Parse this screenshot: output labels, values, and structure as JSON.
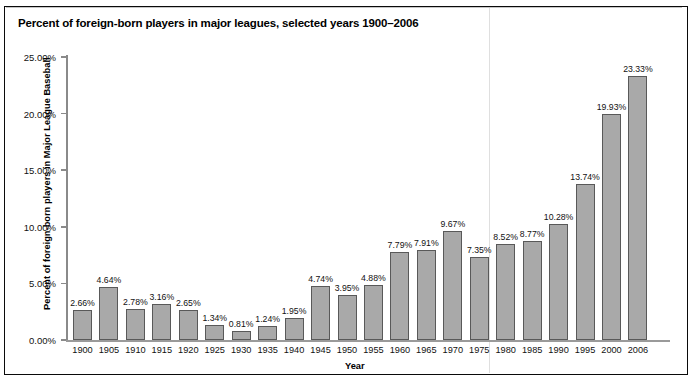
{
  "figure": {
    "title": "Percent of foreign-born players in major leagues, selected years 1900–2006",
    "xlabel": "Year",
    "ylabel": "Percent of foreign-born players in Major League Baseball",
    "bar_fill": "#a9a9a9",
    "bar_border": "#595959",
    "frame_color": "#0a0a0a"
  },
  "chart_data": {
    "type": "bar",
    "title": "Percent of foreign-born players in major leagues, selected years 1900–2006",
    "xlabel": "Year",
    "ylabel": "Percent of foreign-born players in Major League Baseball",
    "ylim": [
      0,
      25
    ],
    "ytick_labels": [
      "25.00%",
      "20.00%",
      "15.00%",
      "10.00%",
      "5.00%",
      "0.00%"
    ],
    "ytick_values": [
      25,
      20,
      15,
      10,
      5,
      0
    ],
    "grid": false,
    "legend": null,
    "categories": [
      "1900",
      "1905",
      "1910",
      "1915",
      "1920",
      "1925",
      "1930",
      "1935",
      "1940",
      "1945",
      "1950",
      "1955",
      "1960",
      "1965",
      "1970",
      "1975",
      "1980",
      "1985",
      "1990",
      "1995",
      "2000",
      "2006"
    ],
    "values": [
      2.66,
      4.64,
      2.78,
      3.16,
      2.65,
      1.34,
      0.81,
      1.24,
      1.95,
      4.74,
      3.95,
      4.88,
      7.79,
      7.91,
      9.67,
      7.35,
      8.52,
      8.77,
      10.28,
      13.74,
      19.93,
      23.33
    ],
    "data_labels": [
      "2.66%",
      "4.64%",
      "2.78%",
      "3.16%",
      "2.65%",
      "1.34%",
      "0.81%",
      "1.24%",
      "1.95%",
      "4.74%",
      "3.95%",
      "4.88%",
      "7.79%",
      "7.91%",
      "9.67%",
      "7.35%",
      "8.52%",
      "8.77%",
      "10.28%",
      "13.74%",
      "19.93%",
      "23.33%"
    ]
  }
}
